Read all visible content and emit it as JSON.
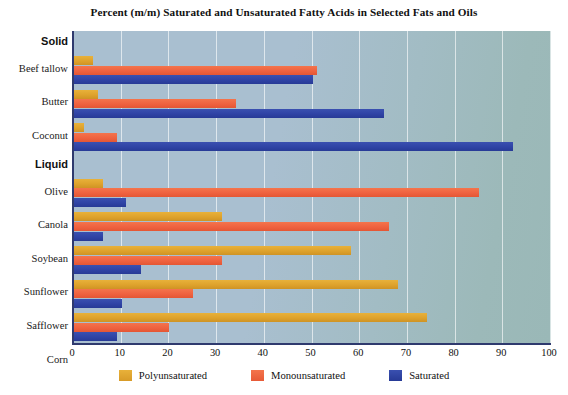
{
  "chart_data": {
    "type": "bar",
    "orientation": "horizontal",
    "title": "Percent (m/m) Saturated and Unsaturated Fatty Acids in Selected Fats and Oils",
    "xlabel": "",
    "ylabel": "",
    "xlim": [
      0,
      100
    ],
    "xticks": [
      0,
      10,
      20,
      30,
      40,
      50,
      60,
      70,
      80,
      90,
      100
    ],
    "xtick_labels": [
      "0",
      "10",
      "20",
      "30",
      "40",
      "50",
      "60",
      "70",
      "80",
      "90",
      "100"
    ],
    "grid": true,
    "grid_axis": "x",
    "legend_position": "bottom-center",
    "group_headers": [
      "Solid",
      "Liquid"
    ],
    "groups": [
      {
        "name": "Solid",
        "categories": [
          "Beef tallow",
          "Butter",
          "Coconut"
        ]
      },
      {
        "name": "Liquid",
        "categories": [
          "Olive",
          "Canola",
          "Soybean",
          "Sunflower",
          "Safflower",
          "Corn"
        ]
      }
    ],
    "categories": [
      "Beef tallow",
      "Butter",
      "Coconut",
      "Olive",
      "Canola",
      "Soybean",
      "Sunflower",
      "Safflower",
      "Corn"
    ],
    "series": [
      {
        "name": "Polyunsaturated",
        "color": "#dea22c",
        "values": [
          4,
          5,
          2,
          6,
          31,
          58,
          68,
          74,
          35
        ]
      },
      {
        "name": "Monounsaturated",
        "color": "#ef6240",
        "values": [
          51,
          34,
          9,
          85,
          66,
          31,
          25,
          20,
          52
        ]
      },
      {
        "name": "Saturated",
        "color": "#2f43a5",
        "values": [
          50,
          65,
          92,
          11,
          6,
          14,
          10,
          9,
          17
        ]
      }
    ]
  },
  "legend": {
    "items": [
      {
        "label": "Polyunsaturated",
        "key": "poly"
      },
      {
        "label": "Monounsaturated",
        "key": "mono"
      },
      {
        "label": "Saturated",
        "key": "sat"
      }
    ]
  },
  "colors": {
    "polyunsaturated": "#dea22c",
    "monounsaturated": "#ef6240",
    "saturated": "#2f43a5",
    "plot_background_left": "#a9bfd0",
    "plot_background_right": "#9ab8b7",
    "axis": "#2f3a6e",
    "gridline": "#ffffff",
    "page_background": "#ffffff",
    "text": "#111111"
  }
}
